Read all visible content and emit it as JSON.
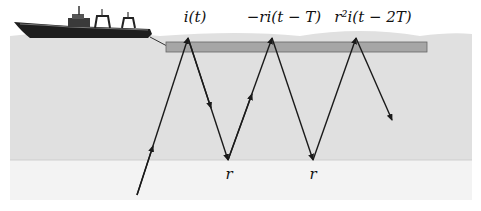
{
  "colors": {
    "water": "#e0e0e0",
    "below": "#f3f3f3",
    "streamer": "#a6a6a6",
    "ray": "#1a1a1a",
    "ship": "#1e1e1e"
  },
  "labels": {
    "incident": "i(t)",
    "first_reflection": "−ri(t − T)",
    "second_reflection": "r²i(t − 2T)",
    "reflection_coeff_1": "r",
    "reflection_coeff_2": "r"
  },
  "rays": [
    {
      "from": [
        137,
        195
      ],
      "to": [
        188,
        38
      ]
    },
    {
      "from": [
        188,
        38
      ],
      "to": [
        228,
        160
      ]
    },
    {
      "from": [
        228,
        160
      ],
      "to": [
        272,
        38
      ]
    },
    {
      "from": [
        272,
        38
      ],
      "to": [
        313,
        160
      ]
    },
    {
      "from": [
        313,
        160
      ],
      "to": [
        356,
        38
      ]
    },
    {
      "from": [
        356,
        38
      ],
      "to": [
        392,
        120
      ]
    }
  ]
}
